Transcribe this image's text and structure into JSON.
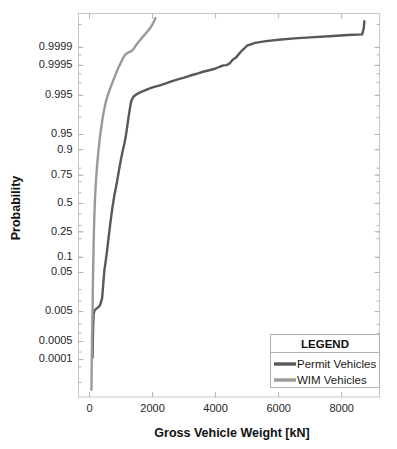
{
  "chart_data": {
    "type": "line",
    "title": "",
    "xlabel": "Gross Vehicle Weight [kN]",
    "ylabel": "Probability",
    "xlim": [
      -350,
      9200
    ],
    "xticks": [
      0,
      2000,
      4000,
      6000,
      8000
    ],
    "xticklabels": [
      "0",
      "2000",
      "4000",
      "6000",
      "8000"
    ],
    "yscale": "normal-probability",
    "ylim": [
      2e-06,
      0.999997
    ],
    "yticks": [
      0.9999,
      0.9995,
      0.995,
      0.95,
      0.9,
      0.75,
      0.5,
      0.25,
      0.1,
      0.05,
      0.005,
      0.0005,
      0.0001
    ],
    "yticklabels": [
      "0.9999",
      "0.9995",
      "0.995",
      "0.95",
      "0.9",
      "0.75",
      "0.5",
      "0.25",
      "0.1",
      "0.05",
      "0.005",
      "0.0005",
      "0.0001"
    ],
    "yminorticks": [
      0.99999,
      0.9999,
      0.9998,
      0.9995,
      0.999,
      0.998,
      0.995,
      0.99,
      0.98,
      0.95,
      0.9,
      0.8,
      0.75,
      0.7,
      0.6,
      0.5,
      0.4,
      0.3,
      0.25,
      0.2,
      0.1,
      0.05,
      0.02,
      0.01,
      0.005,
      0.002,
      0.001,
      0.0005,
      0.0002,
      0.0001,
      5e-05,
      1e-05
    ],
    "grid": false,
    "legend": {
      "position": "lower-right",
      "title": "LEGEND",
      "entries": [
        {
          "label": "Permit Vehicles",
          "color": "#585858"
        },
        {
          "label": "WIM Vehicles",
          "color": "#9a9a9a"
        }
      ]
    },
    "series": [
      {
        "name": "Permit Vehicles",
        "color": "#585858",
        "points": [
          [
            95,
            0.00012
          ],
          [
            105,
            0.0006
          ],
          [
            115,
            0.0018
          ],
          [
            130,
            0.0042
          ],
          [
            160,
            0.0055
          ],
          [
            230,
            0.0062
          ],
          [
            330,
            0.0075
          ],
          [
            400,
            0.012
          ],
          [
            440,
            0.03
          ],
          [
            470,
            0.055
          ],
          [
            500,
            0.075
          ],
          [
            540,
            0.11
          ],
          [
            600,
            0.2
          ],
          [
            660,
            0.32
          ],
          [
            720,
            0.45
          ],
          [
            790,
            0.58
          ],
          [
            860,
            0.68
          ],
          [
            930,
            0.78
          ],
          [
            1000,
            0.855
          ],
          [
            1060,
            0.9
          ],
          [
            1110,
            0.925
          ],
          [
            1160,
            0.95
          ],
          [
            1210,
            0.972
          ],
          [
            1260,
            0.985
          ],
          [
            1320,
            0.9925
          ],
          [
            1390,
            0.9945
          ],
          [
            1470,
            0.9952
          ],
          [
            1570,
            0.9958
          ],
          [
            1700,
            0.9963
          ],
          [
            1850,
            0.9968
          ],
          [
            2000,
            0.99715
          ],
          [
            2200,
            0.9975
          ],
          [
            2400,
            0.99785
          ],
          [
            2600,
            0.9982
          ],
          [
            2800,
            0.99845
          ],
          [
            3000,
            0.99865
          ],
          [
            3200,
            0.99885
          ],
          [
            3400,
            0.999
          ],
          [
            3600,
            0.99915
          ],
          [
            3800,
            0.99925
          ],
          [
            4000,
            0.99935
          ],
          [
            4150,
            0.99945
          ],
          [
            4250,
            0.9995
          ],
          [
            4350,
            0.99951
          ],
          [
            4450,
            0.99958
          ],
          [
            4550,
            0.9997
          ],
          [
            4650,
            0.99975
          ],
          [
            4800,
            0.99985
          ],
          [
            5000,
            0.999915
          ],
          [
            5250,
            0.999935
          ],
          [
            5600,
            0.999945
          ],
          [
            6000,
            0.999952
          ],
          [
            6500,
            0.999958
          ],
          [
            7000,
            0.999962
          ],
          [
            7600,
            0.999966
          ],
          [
            8200,
            0.99997
          ],
          [
            8650,
            0.999972
          ],
          [
            8700,
            0.999985
          ],
          [
            8720,
            0.999993
          ]
        ]
      },
      {
        "name": "WIM Vehicles",
        "color": "#9a9a9a",
        "points": [
          [
            60,
            4.5e-06
          ],
          [
            65,
            2e-05
          ],
          [
            70,
            0.0001
          ],
          [
            78,
            0.0005
          ],
          [
            88,
            0.002
          ],
          [
            95,
            0.006
          ],
          [
            105,
            0.02
          ],
          [
            115,
            0.06
          ],
          [
            128,
            0.15
          ],
          [
            142,
            0.28
          ],
          [
            158,
            0.42
          ],
          [
            175,
            0.55
          ],
          [
            195,
            0.66
          ],
          [
            215,
            0.745
          ],
          [
            240,
            0.82
          ],
          [
            270,
            0.875
          ],
          [
            300,
            0.915
          ],
          [
            330,
            0.943
          ],
          [
            365,
            0.962
          ],
          [
            400,
            0.975
          ],
          [
            440,
            0.984
          ],
          [
            480,
            0.989
          ],
          [
            520,
            0.9925
          ],
          [
            570,
            0.9947
          ],
          [
            620,
            0.9962
          ],
          [
            680,
            0.99735
          ],
          [
            740,
            0.9982
          ],
          [
            800,
            0.99875
          ],
          [
            860,
            0.99915
          ],
          [
            920,
            0.99941
          ],
          [
            980,
            0.99957
          ],
          [
            1030,
            0.99968
          ],
          [
            1080,
            0.999755
          ],
          [
            1130,
            0.9998
          ],
          [
            1180,
            0.999825
          ],
          [
            1240,
            0.99984
          ],
          [
            1300,
            0.999852
          ],
          [
            1360,
            0.99987
          ],
          [
            1420,
            0.999895
          ],
          [
            1480,
            0.99992
          ],
          [
            1540,
            0.999937
          ],
          [
            1610,
            0.999952
          ],
          [
            1680,
            0.999963
          ],
          [
            1760,
            0.999972
          ],
          [
            1850,
            0.99998
          ],
          [
            1950,
            0.999987
          ],
          [
            2030,
            0.999992
          ],
          [
            2090,
            0.999995
          ]
        ]
      }
    ]
  }
}
